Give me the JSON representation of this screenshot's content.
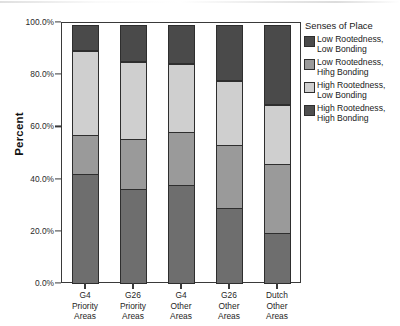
{
  "chart_data": {
    "type": "bar",
    "subtype": "stacked-bar-100-percent",
    "title": "",
    "xlabel": "",
    "ylabel": "Percent",
    "ylim": [
      0,
      100
    ],
    "yticks": [
      0,
      20,
      40,
      60,
      80,
      100
    ],
    "ytick_labels": [
      "0.0%",
      "20.0%",
      "40.0%",
      "60.0%",
      "80.0%",
      "100.0%"
    ],
    "grid": false,
    "legend_position": "right",
    "legend_title": "Senses of Place",
    "categories": [
      "G4\nPriority\nAreas",
      "G26\nPriority\nAreas",
      "G4\nOther\nAreas",
      "G26\nOther\nAreas",
      "Dutch\nOther\nAreas"
    ],
    "category_lines": [
      [
        "G4",
        "Priority",
        "Areas"
      ],
      [
        "G26",
        "Priority",
        "Areas"
      ],
      [
        "G4",
        "Other",
        "Areas"
      ],
      [
        "G26",
        "Other",
        "Areas"
      ],
      [
        "Dutch",
        "Other",
        "Areas"
      ]
    ],
    "series": [
      {
        "name": "High Rootedness, High Bonding",
        "color": "#6E6E6E",
        "stack_order": 1,
        "values": [
          42.0,
          36.5,
          38.0,
          29.0,
          19.5
        ]
      },
      {
        "name": "High Rootedness, Low Bonding",
        "color": "#9A9A9A",
        "stack_order": 2,
        "values": [
          15.5,
          19.5,
          20.5,
          24.5,
          27.0
        ]
      },
      {
        "name": "Low Rootedness, Hihg Bonding",
        "color": "#CFCFCF",
        "stack_order": 3,
        "values": [
          32.5,
          30.0,
          26.5,
          25.0,
          23.0
        ]
      },
      {
        "name": "Low Rootedness, Low Bonding",
        "color": "#4A4A4A",
        "stack_order": 4,
        "values": [
          10.0,
          14.0,
          15.0,
          21.5,
          30.5
        ]
      }
    ],
    "cumulative_boundaries": [
      [
        42.0,
        57.5,
        90.0,
        100.0
      ],
      [
        36.5,
        56.0,
        86.0,
        100.0
      ],
      [
        38.0,
        58.5,
        85.0,
        100.0
      ],
      [
        29.0,
        53.5,
        78.5,
        100.0
      ],
      [
        19.5,
        46.5,
        69.5,
        100.0
      ]
    ]
  },
  "legend": {
    "title": "Senses of Place",
    "items": [
      {
        "label": "Low Rootedness,\nLow Bonding",
        "color": "#4A4A4A"
      },
      {
        "label": "Low Rootedness,\nHihg Bonding",
        "color": "#9A9A9A"
      },
      {
        "label": "High Rootedness,\nLow Bonding",
        "color": "#CFCFCF"
      },
      {
        "label": "High Rootedness,\nHigh Bonding",
        "color": "#4F4F4F"
      }
    ]
  },
  "axes": {
    "y_title": "Percent"
  }
}
